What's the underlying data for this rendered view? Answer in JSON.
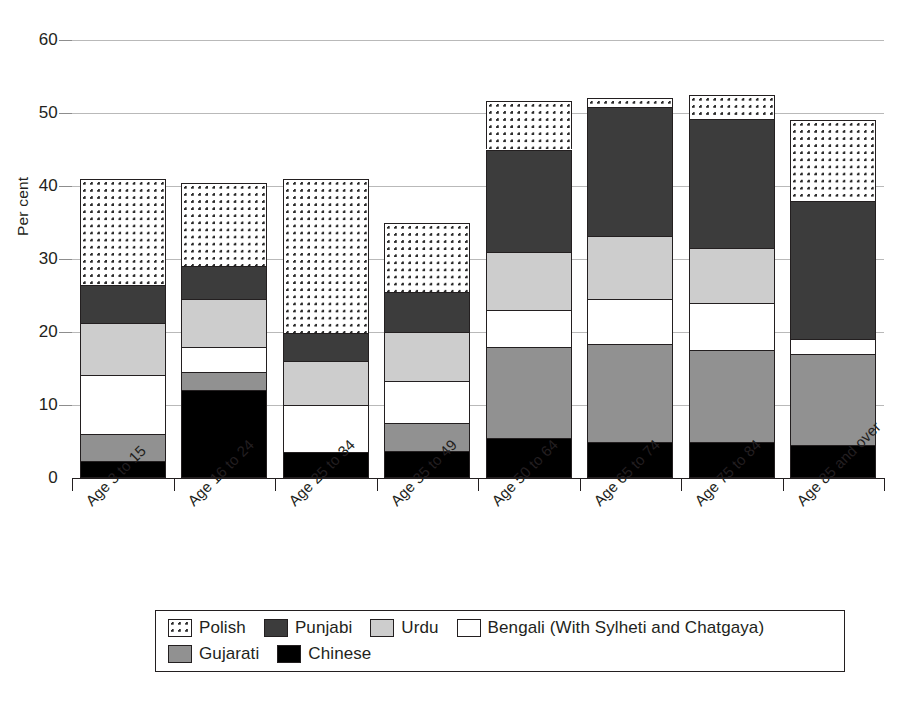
{
  "chart_data": {
    "type": "bar",
    "subtype": "stacked-vertical",
    "title": "",
    "xlabel": "",
    "ylabel": "Per cent",
    "ylim": [
      0,
      60
    ],
    "yticks": [
      0,
      10,
      20,
      30,
      40,
      50,
      60
    ],
    "ytick_labels": [
      "0",
      "10",
      "20",
      "30",
      "40",
      "50",
      "60"
    ],
    "grid": true,
    "grid_axis": "y",
    "legend_position": "bottom",
    "stack_order_bottom_to_top": [
      "Chinese",
      "Gujarati",
      "Bengali (With Sylheti and Chatgaya)",
      "Urdu",
      "Punjabi",
      "Polish"
    ],
    "categories": [
      "Age 3 to 15",
      "Age 16 to 24",
      "Age 25 to 34",
      "Age 35 to 49",
      "Age 50 to 64",
      "Age 65 to 74",
      "Age 75 to 84",
      "Age 85 and over"
    ],
    "series": [
      {
        "name": "Chinese",
        "color": "#000000",
        "pattern": "solid",
        "values": [
          2.3,
          12.0,
          3.5,
          3.7,
          5.5,
          4.9,
          4.9,
          4.5
        ]
      },
      {
        "name": "Gujarati",
        "color": "#919191",
        "pattern": "solid",
        "values": [
          3.7,
          2.5,
          0.0,
          3.8,
          12.5,
          13.5,
          12.6,
          12.5
        ]
      },
      {
        "name": "Bengali (With Sylheti and Chatgaya)",
        "color": "#ffffff",
        "pattern": "solid",
        "values": [
          8.1,
          3.5,
          6.5,
          5.8,
          5.0,
          6.1,
          6.5,
          2.0
        ]
      },
      {
        "name": "Urdu",
        "color": "#cdcdcd",
        "pattern": "solid",
        "values": [
          7.2,
          6.5,
          6.0,
          6.7,
          8.0,
          8.7,
          7.5,
          0.0
        ]
      },
      {
        "name": "Punjabi",
        "color": "#3c3c3c",
        "pattern": "solid",
        "values": [
          5.2,
          4.5,
          3.8,
          5.5,
          14.0,
          17.6,
          17.7,
          19.0
        ]
      },
      {
        "name": "Polish",
        "color": "#ffffff",
        "pattern": "dotted",
        "values": [
          14.5,
          11.4,
          21.2,
          9.5,
          6.7,
          1.3,
          3.3,
          11.0
        ]
      }
    ],
    "totals": [
      41.0,
      40.4,
      41.0,
      35.0,
      51.7,
      52.1,
      52.5,
      49.0
    ]
  },
  "legend": {
    "items": [
      {
        "label": "Polish",
        "swatch": "dotted-swatch"
      },
      {
        "label": "Punjabi",
        "swatch": "dark-gray-swatch"
      },
      {
        "label": "Urdu",
        "swatch": "light-gray-swatch"
      },
      {
        "label": "Bengali (With Sylheti and Chatgaya)",
        "swatch": "white-swatch"
      },
      {
        "label": "Gujarati",
        "swatch": "mid-gray-swatch"
      },
      {
        "label": "Chinese",
        "swatch": "black-swatch"
      }
    ]
  }
}
